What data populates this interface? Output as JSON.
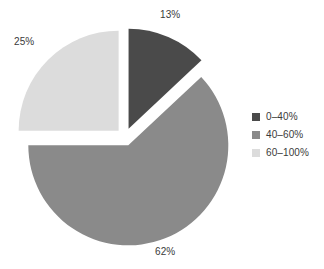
{
  "chart_data": {
    "type": "pie",
    "title": "",
    "labels": [
      "0–40%",
      "40–60%",
      "60–100%"
    ],
    "values": [
      13,
      62,
      25
    ],
    "value_labels": [
      "13%",
      "62%",
      "25%"
    ],
    "colors": [
      "#4a4a4a",
      "#8a8a8a",
      "#dcdcdc"
    ],
    "exploded": true,
    "start_angle_deg": 0,
    "direction": "clockwise",
    "legend_position": "right",
    "grid": false,
    "background": "#ffffff",
    "text_color": "#3a3a3a"
  },
  "legend": {
    "items": [
      {
        "label": "0–40%",
        "color": "#4a4a4a"
      },
      {
        "label": "40–60%",
        "color": "#8a8a8a"
      },
      {
        "label": "60–100%",
        "color": "#dcdcdc"
      }
    ]
  },
  "slice_labels": {
    "dark": "13%",
    "medium": "62%",
    "light": "25%"
  }
}
